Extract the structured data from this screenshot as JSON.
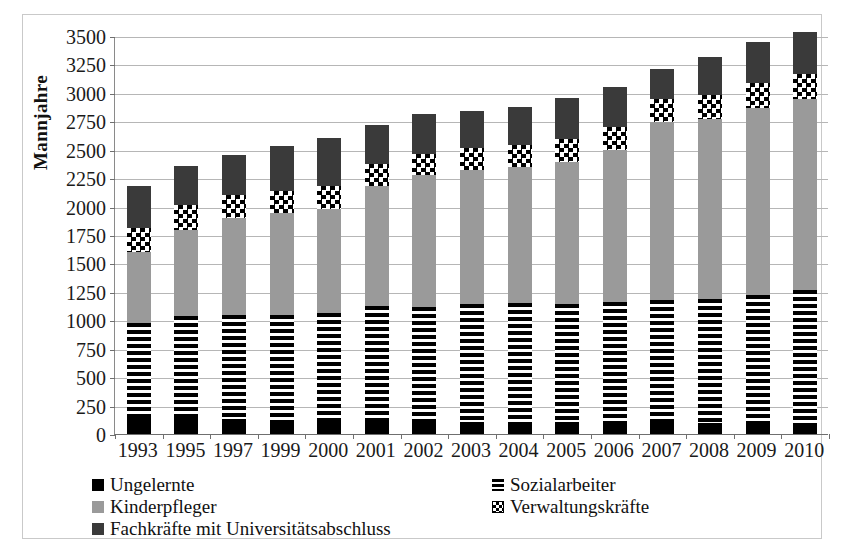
{
  "chart_data": {
    "type": "bar",
    "stacked": true,
    "title": "",
    "subtitle": "",
    "xlabel": "",
    "ylabel": "Mannjahre",
    "ylim": [
      0,
      3500
    ],
    "ytick_step": 250,
    "yticks": [
      0,
      250,
      500,
      750,
      1000,
      1250,
      1500,
      1750,
      2000,
      2250,
      2500,
      2750,
      3000,
      3250,
      3500
    ],
    "ytick_labels": [
      "0",
      "250",
      "500",
      "750",
      "1000",
      "1250",
      "1500",
      "1750",
      "2000",
      "2250",
      "2500",
      "2750",
      "3000",
      "3250",
      "3500"
    ],
    "grid": true,
    "legend_position": "bottom",
    "categories": [
      "1993",
      "1995",
      "1997",
      "1999",
      "2000",
      "2001",
      "2002",
      "2003",
      "2004",
      "2005",
      "2006",
      "2007",
      "2008",
      "2009",
      "2010"
    ],
    "series": [
      {
        "name": "Ungelernte",
        "color": "#000000",
        "pattern": "solid-black",
        "values": [
          140,
          145,
          130,
          120,
          120,
          115,
          110,
          110,
          105,
          105,
          105,
          105,
          100,
          100,
          100
        ]
      },
      {
        "name": "Sozialarbeiter",
        "color": "#000000",
        "pattern": "horizontal-stripes",
        "values": [
          840,
          890,
          920,
          930,
          940,
          1010,
          1010,
          1035,
          1050,
          1040,
          1055,
          1070,
          1090,
          1125,
          1165
        ]
      },
      {
        "name": "Kinderpfleger",
        "color": "#9a9a9a",
        "pattern": "solid-gray",
        "values": [
          620,
          760,
          850,
          890,
          920,
          1060,
          1160,
          1180,
          1195,
          1250,
          1340,
          1570,
          1580,
          1640,
          1680
        ]
      },
      {
        "name": "Verwaltungskräfte",
        "color": "#000000",
        "pattern": "checkerboard",
        "values": [
          210,
          215,
          200,
          195,
          200,
          190,
          185,
          190,
          195,
          195,
          200,
          205,
          215,
          220,
          220
        ]
      },
      {
        "name": "Fachkräfte mit Universitätsabschluss",
        "color": "#3a3a3a",
        "pattern": "solid-dark-gray",
        "values": [
          370,
          350,
          350,
          400,
          420,
          345,
          345,
          330,
          335,
          365,
          355,
          260,
          330,
          365,
          370
        ]
      }
    ],
    "totals": [
      2180,
      2360,
      2450,
      2535,
      2600,
      2720,
      2810,
      2845,
      2880,
      2955,
      3055,
      3210,
      3315,
      3450,
      3535
    ]
  },
  "legend": {
    "items": [
      {
        "label": "Ungelernte",
        "swatch": "solid-black-swatch"
      },
      {
        "label": "Sozialarbeiter",
        "swatch": "striped-swatch"
      },
      {
        "label": "Kinderpfleger",
        "swatch": "solid-gray-swatch"
      },
      {
        "label": "Verwaltungskräfte",
        "swatch": "checkerboard-swatch"
      },
      {
        "label": "Fachkräfte mit Universitätsabschluss",
        "swatch": "solid-dark-gray-swatch"
      }
    ]
  }
}
